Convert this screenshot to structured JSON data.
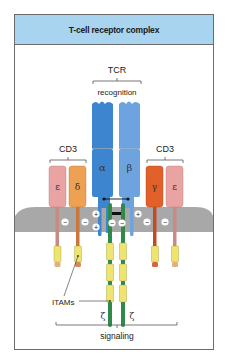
{
  "title": "T-cell receptor complex",
  "labels": {
    "tcr": "TCR",
    "recognition": "recognition",
    "cd3_left": "CD3",
    "cd3_right": "CD3",
    "itams": "ITAMs",
    "signaling": "signaling"
  },
  "chains": {
    "alpha": "α",
    "beta": "β",
    "epsilon_left": "ε",
    "delta": "δ",
    "gamma": "γ",
    "epsilon_right": "ε",
    "zeta_left": "ζ",
    "zeta_right": "ζ"
  },
  "charges": {
    "plus": "+",
    "minus": "−"
  },
  "colors": {
    "header": "#a9d4f0",
    "alpha": "#3d86cf",
    "beta": "#6da3de",
    "epsilon": "#e9a3a3",
    "delta": "#eea053",
    "gamma": "#e2602a",
    "zeta": "#2f8a4a",
    "itam": "#efe470",
    "membrane": "#a8a8a8"
  }
}
